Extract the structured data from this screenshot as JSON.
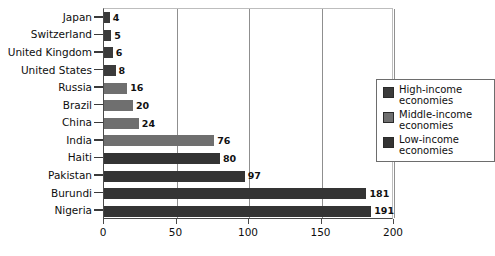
{
  "chart_data": {
    "type": "bar",
    "orientation": "horizontal",
    "title": "",
    "subtitle": "",
    "xlabel": "",
    "ylabel": "",
    "xlim": [
      0,
      200
    ],
    "ylim": null,
    "grid": "vertical",
    "xticks": [
      0,
      50,
      100,
      150,
      200
    ],
    "xtick_labels": [
      "0",
      "50",
      "100",
      "150",
      "200"
    ],
    "categories": [
      "Japan",
      "Switzerland",
      "United Kingdom",
      "United States",
      "Russia",
      "Brazil",
      "China",
      "India",
      "Haiti",
      "Pakistan",
      "Burundi",
      "Nigeria"
    ],
    "values": [
      4,
      5,
      6,
      8,
      16,
      20,
      24,
      76,
      80,
      97,
      181,
      191
    ],
    "value_labels": [
      "4",
      "5",
      "6",
      "8",
      "16",
      "20",
      "24",
      "76",
      "80",
      "97",
      "181",
      "191"
    ],
    "groups": [
      "high",
      "high",
      "high",
      "high",
      "middle",
      "middle",
      "middle",
      "middle",
      "low",
      "low",
      "low",
      "low"
    ],
    "legend_position": "upper right",
    "legend": {
      "entries": [
        {
          "key": "high",
          "label": "High-income\neconomies",
          "color": "#3b3b3b"
        },
        {
          "key": "middle",
          "label": "Middle-income\neconomies",
          "color": "#6f6f6f"
        },
        {
          "key": "low",
          "label": "Low-income\neconomies",
          "color": "#343434"
        }
      ]
    },
    "colors": {
      "high": "#3b3b3b",
      "middle": "#6f6f6f",
      "low": "#343434",
      "gridline": "#8f8f8f",
      "axis": "#4a4a4a",
      "background": "#ffffff",
      "text": "#0e0e0e"
    }
  }
}
